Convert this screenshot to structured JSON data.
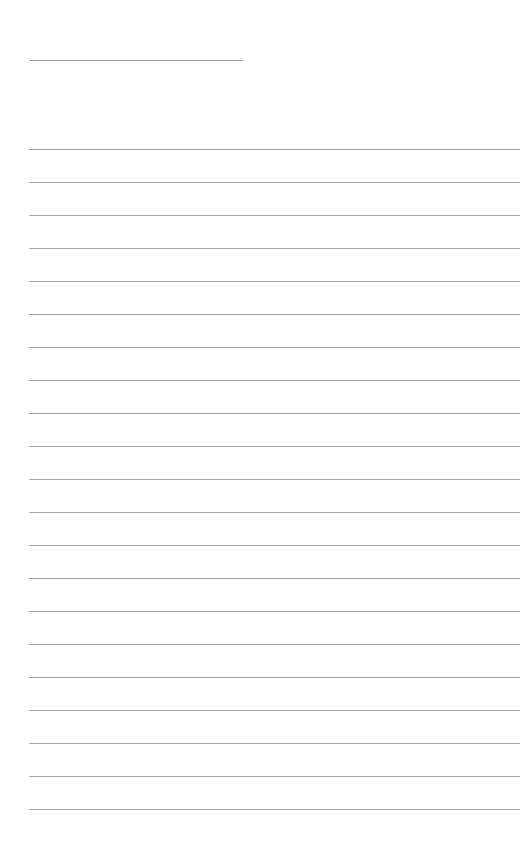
{
  "page": {
    "type": "blank-lined-paper",
    "title_field": {
      "value": ""
    },
    "lines": [
      {
        "value": ""
      },
      {
        "value": ""
      },
      {
        "value": ""
      },
      {
        "value": ""
      },
      {
        "value": ""
      },
      {
        "value": ""
      },
      {
        "value": ""
      },
      {
        "value": ""
      },
      {
        "value": ""
      },
      {
        "value": ""
      },
      {
        "value": ""
      },
      {
        "value": ""
      },
      {
        "value": ""
      },
      {
        "value": ""
      },
      {
        "value": ""
      },
      {
        "value": ""
      },
      {
        "value": ""
      },
      {
        "value": ""
      },
      {
        "value": ""
      },
      {
        "value": ""
      },
      {
        "value": ""
      }
    ],
    "colors": {
      "background": "#ffffff",
      "rule": "#a6a6a6"
    }
  }
}
